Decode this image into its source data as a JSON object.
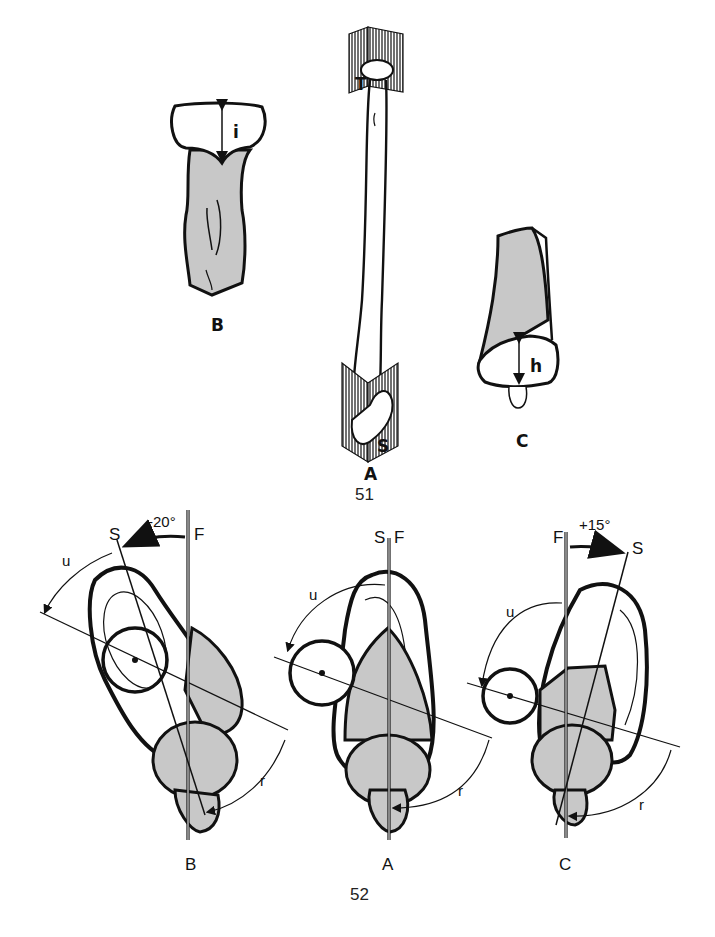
{
  "colors": {
    "ink": "#111111",
    "shade": "#c8c8c8",
    "paper": "#ffffff"
  },
  "figure51": {
    "number": "51",
    "panels": {
      "B": {
        "label": "B",
        "dimension": "i"
      },
      "A": {
        "label": "A",
        "plane_top": "T",
        "plane_bottom": "S"
      },
      "C": {
        "label": "C",
        "dimension": "h"
      }
    }
  },
  "figure52": {
    "number": "52",
    "panels": {
      "B": {
        "label": "B",
        "angle": "-20°",
        "axis_s": "S",
        "axis_f": "F",
        "arc_u": "u",
        "arc_r": "r"
      },
      "A": {
        "label": "A",
        "axis_s": "S",
        "axis_f": "F",
        "arc_u": "u",
        "arc_r": "r"
      },
      "C": {
        "label": "C",
        "angle": "+15°",
        "axis_s": "S",
        "axis_f": "F",
        "arc_u": "u",
        "arc_r": "r"
      }
    }
  }
}
